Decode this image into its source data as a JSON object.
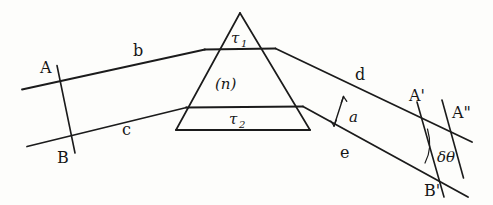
{
  "figure": {
    "ink_color": "#161616",
    "background_color": "#fdfdfb"
  },
  "labels": {
    "tau1": "τ",
    "tau1_sub": "1",
    "tau2": "τ",
    "tau2_sub": "2",
    "index": "(n)",
    "ray_b": "b",
    "ray_c": "c",
    "ray_d": "d",
    "ray_e": "e",
    "beam_width": "a",
    "point_A": "A",
    "point_B": "B",
    "point_A_prime": "A'",
    "point_A_double_prime": "A\"",
    "point_B_prime": "B'",
    "deviation": "δθ"
  },
  "geometry": {
    "prism": {
      "apex": [
        240,
        13
      ],
      "base_left": [
        176,
        130
      ],
      "base_right": [
        310,
        130
      ],
      "chord_tau1_y": 49,
      "chord_tau2_y": 107
    },
    "incoming_rays": {
      "b_start": [
        22,
        89
      ],
      "b_end": [
        205,
        49
      ],
      "c_start": [
        27,
        146
      ],
      "c_end": [
        186,
        107
      ]
    },
    "outgoing_rays": {
      "d_start": [
        275,
        49
      ],
      "d_end": [
        470,
        142
      ],
      "e_start": [
        303,
        121
      ],
      "e_end": [
        466,
        197
      ]
    },
    "wavefront_AB": {
      "top": [
        57,
        66
      ],
      "bottom": [
        75,
        152
      ]
    },
    "wavefront_ABprime": {
      "top": [
        418,
        103
      ],
      "bottom": [
        443,
        196
      ]
    },
    "line_A2": {
      "top": [
        440,
        101
      ],
      "bottom": [
        462,
        178
      ]
    }
  }
}
